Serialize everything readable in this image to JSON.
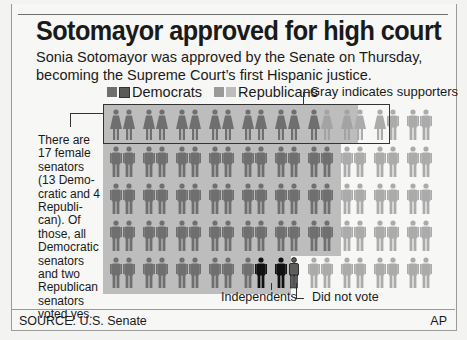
{
  "title": "Sotomayor approved for high court",
  "subtitle": "Sonia Sotomayor was approved by the Senate on Thursday, becoming the Supreme Court’s first Hispanic justice.",
  "legend": {
    "democrats": "Democrats",
    "republicans": "Republicans",
    "supporters_note": "Gray indicates supporters"
  },
  "colors": {
    "democrat": "#6f6f6f",
    "republican": "#ababab",
    "independent": "#111111",
    "supporter_bg": "#bdbdbd",
    "background": "#f7f7f5"
  },
  "note": "There are 17 female senators (13 Demo- cratic and 4 Republi- can). Of those, all Democratic senators and two Republican senators voted yes.",
  "annotations": {
    "independents": "Independents",
    "did_not_vote": "Did not vote"
  },
  "footer": {
    "source": "SOURCE: U.S. Senate",
    "credit": "AP"
  },
  "chart_data": {
    "type": "pictogram",
    "title": "Sotomayor approved for high court",
    "subtitle": "Sonia Sotomayor was approved by the Senate on Thursday, becoming the Supreme Court’s first Hispanic justice.",
    "total_senators": 100,
    "layout": {
      "rows": 5,
      "columns": 20
    },
    "legend": [
      "Democrats",
      "Republicans",
      "Gray indicates supporters"
    ],
    "rows": [
      [
        "DF",
        "DF",
        "DF",
        "DF",
        "DF",
        "DF",
        "DF",
        "DF",
        "DF",
        "DF",
        "DF",
        "DF",
        "DF",
        "RFs",
        "RFs",
        "RF",
        "RF",
        "RM",
        "RM",
        "RM"
      ],
      [
        "D",
        "D",
        "D",
        "D",
        "D",
        "D",
        "D",
        "D",
        "D",
        "D",
        "D",
        "D",
        "D",
        "D",
        "R",
        "R",
        "R",
        "R",
        "R",
        "R"
      ],
      [
        "D",
        "D",
        "D",
        "D",
        "D",
        "D",
        "D",
        "D",
        "D",
        "D",
        "D",
        "D",
        "D",
        "D",
        "R",
        "R",
        "R",
        "R",
        "R",
        "R"
      ],
      [
        "D",
        "D",
        "D",
        "D",
        "D",
        "D",
        "D",
        "D",
        "D",
        "D",
        "D",
        "D",
        "D",
        "D",
        "R",
        "R",
        "R",
        "R",
        "R",
        "R"
      ],
      [
        "D",
        "D",
        "D",
        "D",
        "D",
        "D",
        "D",
        "D",
        "D",
        "I",
        "I",
        "NV",
        "R",
        "R",
        "R",
        "R",
        "R",
        "R",
        "R",
        "R"
      ]
    ],
    "key": {
      "D": "Democrat (male)",
      "DF": "Democrat (female)",
      "R": "Republican (male)",
      "RF": "Republican (female)",
      "RFs": "Republican female supporter",
      "RM": "Republican (male)",
      "I": "Independent",
      "NV": "Did not vote"
    },
    "counts": {
      "democrats": 60,
      "republicans": 38,
      "independents": 2,
      "female_senators": 17,
      "female_democrats": 13,
      "female_republicans": 4,
      "female_yes": 15,
      "did_not_vote": 1
    },
    "source": "SOURCE: U.S. Senate",
    "credit": "AP"
  }
}
